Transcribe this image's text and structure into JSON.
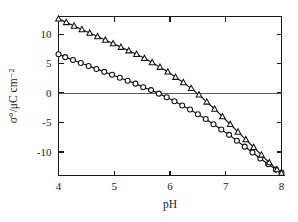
{
  "chart_data": {
    "type": "scatter",
    "title": "",
    "subtitle": "",
    "xlabel": "pH",
    "ylabel": "σ°/μC cm⁻²",
    "xlim": [
      4,
      8
    ],
    "ylim": [
      -14,
      13
    ],
    "y_axis_inverted": true,
    "grid": false,
    "legend_position": "none",
    "xticks": [
      4,
      5,
      6,
      7,
      8
    ],
    "xticklabels": [
      "4",
      "5",
      "6",
      "7",
      "8"
    ],
    "yticks": [
      -10,
      -5,
      0,
      5,
      10
    ],
    "yticklabels": [
      "-10",
      "-5",
      "0",
      "5",
      "10"
    ],
    "zero_reference_line": 0,
    "annotations": [],
    "series": [
      {
        "name": "circles",
        "marker": "circle",
        "x": [
          4.0,
          4.12,
          4.26,
          4.4,
          4.54,
          4.68,
          4.82,
          4.96,
          5.1,
          5.24,
          5.38,
          5.52,
          5.66,
          5.8,
          5.94,
          6.08,
          6.22,
          6.36,
          6.5,
          6.64,
          6.78,
          6.92,
          7.06,
          7.2,
          7.34,
          7.48,
          7.62,
          7.76,
          7.9,
          8.0
        ],
        "y": [
          6.6,
          6.1,
          5.6,
          5.1,
          4.6,
          4.1,
          3.6,
          3.1,
          2.6,
          2.1,
          1.6,
          1.0,
          0.5,
          -0.1,
          -0.7,
          -1.4,
          -2.1,
          -2.8,
          -3.6,
          -4.4,
          -5.3,
          -6.2,
          -7.1,
          -8.1,
          -9.1,
          -10.1,
          -11.1,
          -12.1,
          -13.0,
          -13.5
        ]
      },
      {
        "name": "triangles",
        "marker": "triangle",
        "x": [
          4.0,
          4.14,
          4.28,
          4.42,
          4.56,
          4.7,
          4.84,
          4.98,
          5.12,
          5.26,
          5.4,
          5.54,
          5.68,
          5.82,
          5.96,
          6.1,
          6.24,
          6.38,
          6.52,
          6.66,
          6.8,
          6.94,
          7.08,
          7.22,
          7.36,
          7.5,
          7.64,
          7.78,
          7.92,
          8.0
        ],
        "y": [
          12.6,
          12.0,
          11.4,
          10.8,
          10.2,
          9.6,
          9.0,
          8.4,
          7.8,
          7.2,
          6.6,
          5.9,
          5.2,
          4.4,
          3.6,
          2.7,
          1.8,
          0.8,
          -0.3,
          -1.5,
          -2.7,
          -4.0,
          -5.3,
          -6.6,
          -7.9,
          -9.2,
          -10.5,
          -11.8,
          -13.0,
          -13.6
        ]
      }
    ]
  }
}
